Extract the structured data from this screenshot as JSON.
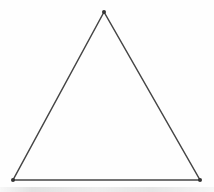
{
  "figure": {
    "shape": "triangle",
    "canvas": {
      "width": "214",
      "height": "192"
    },
    "background_color": "#fefefe",
    "stroke_color": "#454545",
    "stroke_width": "1.5",
    "vertex_dot_color": "#333333",
    "vertex_dot_radius": "2",
    "polygon_points": "104,12 13,180 200,180",
    "vertices": [
      {
        "label": "apex",
        "cx": "104",
        "cy": "12"
      },
      {
        "label": "bottom-left",
        "cx": "13",
        "cy": "180"
      },
      {
        "label": "bottom-right",
        "cx": "200",
        "cy": "180"
      }
    ]
  }
}
